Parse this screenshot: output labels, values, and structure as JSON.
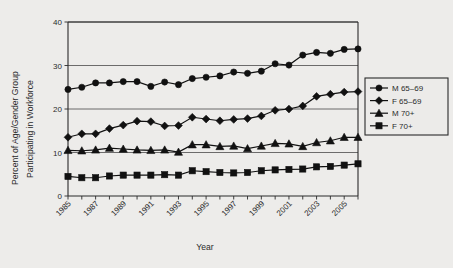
{
  "chart_data": {
    "type": "line",
    "title": "",
    "xlabel": "Year",
    "ylabel": "Percent of Age/Gender Group Participating in Workforce",
    "ylabel_line1": "Percent of Age/Gender Group",
    "ylabel_line2": "Participating in Workforce",
    "xlim": [
      1985,
      2006
    ],
    "ylim": [
      0,
      40
    ],
    "yticks": [
      0,
      10,
      20,
      30,
      40
    ],
    "ytick_labels": [
      "0",
      "10",
      "20",
      "30",
      "40"
    ],
    "xticks": [
      1985,
      1986,
      1987,
      1988,
      1989,
      1990,
      1991,
      1992,
      1993,
      1994,
      1995,
      1996,
      1997,
      1998,
      1999,
      2000,
      2001,
      2002,
      2003,
      2004,
      2005,
      2006
    ],
    "xtick_labels_shown": [
      "1985",
      "1987",
      "1989",
      "1991",
      "1993",
      "1995",
      "1997",
      "1999",
      "2001",
      "2003",
      "2005"
    ],
    "xtick_label_rotation": 45,
    "grid": "horizontal",
    "legend_position": "right",
    "x": [
      1985,
      1986,
      1987,
      1988,
      1989,
      1990,
      1991,
      1992,
      1993,
      1994,
      1995,
      1996,
      1997,
      1998,
      1999,
      2000,
      2001,
      2002,
      2003,
      2004,
      2005,
      2006
    ],
    "series": [
      {
        "name": "M 65-69",
        "marker": "circle",
        "color": "#111111",
        "values": [
          24.5,
          25.0,
          26.0,
          26.0,
          26.3,
          26.3,
          25.2,
          26.2,
          25.6,
          27.0,
          27.3,
          27.6,
          28.5,
          28.2,
          28.7,
          30.4,
          30.1,
          32.4,
          33.0,
          32.8,
          33.7,
          33.8
        ]
      },
      {
        "name": "F 65-69",
        "marker": "diamond",
        "color": "#111111",
        "values": [
          13.5,
          14.3,
          14.3,
          15.5,
          16.3,
          17.2,
          17.1,
          16.1,
          16.2,
          18.1,
          17.7,
          17.3,
          17.6,
          17.8,
          18.4,
          19.7,
          20.0,
          20.7,
          22.9,
          23.4,
          23.9,
          24.0
        ]
      },
      {
        "name": "M 70+",
        "marker": "triangle",
        "color": "#111111",
        "values": [
          10.5,
          10.4,
          10.6,
          11.0,
          10.8,
          10.6,
          10.5,
          10.6,
          10.1,
          11.8,
          11.8,
          11.4,
          11.5,
          10.9,
          11.5,
          12.1,
          12.0,
          11.4,
          12.3,
          12.7,
          13.5,
          13.5
        ]
      },
      {
        "name": "F 70+",
        "marker": "square",
        "color": "#111111",
        "values": [
          4.5,
          4.2,
          4.2,
          4.6,
          4.8,
          4.8,
          4.8,
          4.9,
          4.8,
          5.8,
          5.6,
          5.4,
          5.3,
          5.4,
          5.8,
          6.0,
          6.1,
          6.2,
          6.7,
          6.8,
          7.1,
          7.4
        ]
      }
    ],
    "legend": [
      {
        "label": "M 65–69",
        "marker": "circle"
      },
      {
        "label": "F 65–69",
        "marker": "diamond"
      },
      {
        "label": "M 70+",
        "marker": "triangle"
      },
      {
        "label": "F 70+",
        "marker": "square"
      }
    ]
  }
}
